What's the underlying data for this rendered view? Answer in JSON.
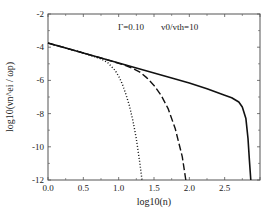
{
  "chart_data": {
    "type": "line",
    "title": "",
    "xlabel": "log10(n)",
    "ylabel": "log10(νn^ei / ωp)",
    "xlim": [
      0.0,
      3.0
    ],
    "ylim": [
      -12,
      -2
    ],
    "xticks": [
      0.0,
      0.5,
      1.0,
      1.5,
      2.0,
      2.5,
      3.0
    ],
    "xtick_labels": [
      "0.0",
      "0.5",
      "1.0",
      "1.5",
      "2.0",
      "2.5",
      ""
    ],
    "yticks": [
      -2,
      -4,
      -6,
      -8,
      -10,
      -12
    ],
    "ytick_labels": [
      "-2",
      "-4",
      "-6",
      "-8",
      "-10",
      "-12"
    ],
    "grid": false,
    "annotations": [
      {
        "text": "Γ=0.10",
        "x": 0.99,
        "y": -2.95
      },
      {
        "text": "v0/vth=10",
        "x": 1.6,
        "y": -2.95
      }
    ],
    "series": [
      {
        "name": "solid",
        "style": "solid",
        "x": [
          0.0,
          0.25,
          0.5,
          0.75,
          1.0,
          1.25,
          1.5,
          1.75,
          2.0,
          2.25,
          2.5,
          2.6,
          2.7,
          2.75,
          2.8,
          2.83,
          2.85,
          2.87
        ],
        "y": [
          -3.75,
          -4.05,
          -4.35,
          -4.65,
          -4.95,
          -5.25,
          -5.55,
          -5.85,
          -6.15,
          -6.5,
          -6.9,
          -7.05,
          -7.3,
          -7.6,
          -8.3,
          -9.5,
          -10.8,
          -12.0
        ]
      },
      {
        "name": "dashed",
        "style": "dashed",
        "x": [
          0.0,
          0.25,
          0.5,
          0.75,
          1.0,
          1.1,
          1.2,
          1.3,
          1.4,
          1.5,
          1.6,
          1.7,
          1.8,
          1.9,
          1.95
        ],
        "y": [
          -3.75,
          -4.05,
          -4.35,
          -4.65,
          -4.97,
          -5.1,
          -5.28,
          -5.5,
          -5.85,
          -6.3,
          -6.9,
          -7.7,
          -8.9,
          -10.6,
          -12.0
        ]
      },
      {
        "name": "dotted",
        "style": "dotted",
        "x": [
          0.0,
          0.25,
          0.5,
          0.75,
          0.85,
          0.95,
          1.0,
          1.05,
          1.1,
          1.15,
          1.2,
          1.25,
          1.3,
          1.33
        ],
        "y": [
          -3.75,
          -4.05,
          -4.35,
          -4.7,
          -4.95,
          -5.4,
          -5.75,
          -6.2,
          -6.8,
          -7.5,
          -8.4,
          -9.5,
          -11.0,
          -12.0
        ]
      }
    ]
  }
}
